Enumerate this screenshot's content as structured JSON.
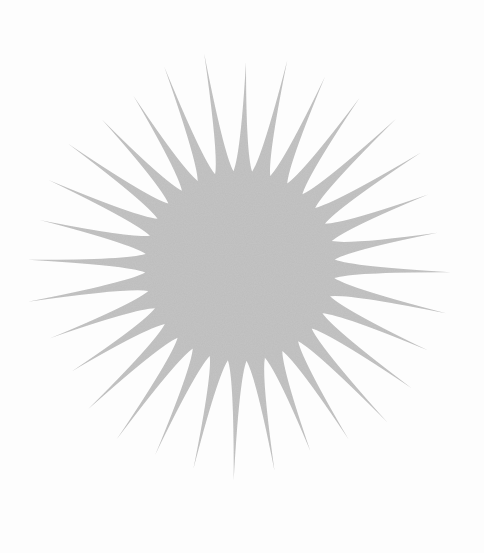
{
  "image": {
    "description": "Gray starburst (sun) illustration on a near-white paper background",
    "background_color": "#fdfdfd",
    "shape": {
      "type": "starburst",
      "fill_color": "#c4c4c4",
      "ray_count": 32,
      "center": [
        240,
        266
      ],
      "core_radius": 95,
      "ray_tip_radius": 208
    }
  }
}
